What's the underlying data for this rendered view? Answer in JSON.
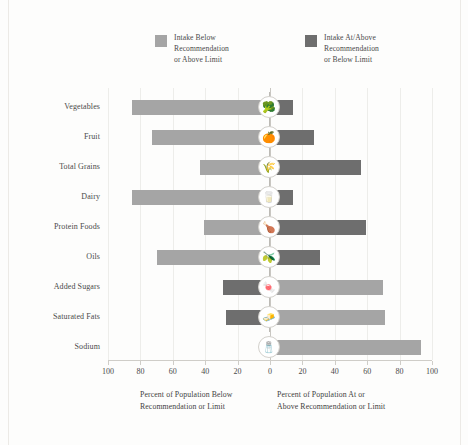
{
  "legend": {
    "items": [
      {
        "label": "Intake Below\nRecommendation\nor Above Limit",
        "color": "#a5a5a5",
        "name": "legend-below"
      },
      {
        "label": "Intake At/Above\nRecommendation\nor Below Limit",
        "color": "#6e6e6e",
        "name": "legend-at-above"
      }
    ]
  },
  "axes": {
    "y_title": "Food Group or Dietary Component",
    "x_caption_left": "Percent of Population Below\nRecommendation or Limit",
    "x_caption_right": "Percent of Population At or\nAbove Recommendation or Limit",
    "x_ticks": [
      "100",
      "80",
      "60",
      "40",
      "20",
      "0",
      "20",
      "40",
      "60",
      "80",
      "100"
    ]
  },
  "chart_data": {
    "type": "bar",
    "title": "",
    "xlabel": "Percent of Population",
    "ylabel": "Food Group or Dietary Component",
    "xlim": [
      -100,
      100
    ],
    "grid": true,
    "legend_position": "top",
    "categories": [
      "Vegetables",
      "Fruit",
      "Total Grains",
      "Dairy",
      "Protein Foods",
      "Oils",
      "Added Sugars",
      "Saturated Fats",
      "Sodium"
    ],
    "series": [
      {
        "name": "Intake Below Recommendation or Above Limit",
        "color": "#a5a5a5",
        "values": [
          85,
          73,
          43,
          85,
          41,
          70,
          70,
          71,
          93
        ]
      },
      {
        "name": "Intake At/Above Recommendation or Below Limit",
        "color": "#6e6e6e",
        "values": [
          14,
          27,
          56,
          14,
          59,
          31,
          29,
          27,
          4
        ]
      }
    ],
    "rows": [
      {
        "category": "Vegetables",
        "icon": "vegetables-icon",
        "glyph": "🥦",
        "left_value": 85,
        "left_color": "#a5a5a5",
        "right_value": 14,
        "right_color": "#6e6e6e"
      },
      {
        "category": "Fruit",
        "icon": "fruit-icon",
        "glyph": "🍊",
        "left_value": 73,
        "left_color": "#a5a5a5",
        "right_value": 27,
        "right_color": "#6e6e6e"
      },
      {
        "category": "Total Grains",
        "icon": "grains-icon",
        "glyph": "🌾",
        "left_value": 43,
        "left_color": "#a5a5a5",
        "right_value": 56,
        "right_color": "#6e6e6e"
      },
      {
        "category": "Dairy",
        "icon": "dairy-icon",
        "glyph": "🥛",
        "left_value": 85,
        "left_color": "#a5a5a5",
        "right_value": 14,
        "right_color": "#6e6e6e"
      },
      {
        "category": "Protein Foods",
        "icon": "protein-foods-icon",
        "glyph": "🍗",
        "left_value": 41,
        "left_color": "#a5a5a5",
        "right_value": 59,
        "right_color": "#6e6e6e"
      },
      {
        "category": "Oils",
        "icon": "oils-icon",
        "glyph": "🫒",
        "left_value": 70,
        "left_color": "#a5a5a5",
        "right_value": 31,
        "right_color": "#6e6e6e"
      },
      {
        "category": "Added Sugars",
        "icon": "added-sugars-icon",
        "glyph": "🍬",
        "left_value": 29,
        "left_color": "#6e6e6e",
        "right_value": 70,
        "right_color": "#a5a5a5"
      },
      {
        "category": "Saturated Fats",
        "icon": "saturated-fats-icon",
        "glyph": "🧈",
        "left_value": 27,
        "left_color": "#6e6e6e",
        "right_value": 71,
        "right_color": "#a5a5a5"
      },
      {
        "category": "Sodium",
        "icon": "sodium-icon",
        "glyph": "🧂",
        "left_value": 4,
        "left_color": "#6e6e6e",
        "right_value": 93,
        "right_color": "#a5a5a5"
      }
    ]
  },
  "colors": {
    "light_bar": "#a5a5a5",
    "dark_bar": "#6e6e6e",
    "grid": "#ededea",
    "axis": "#cfcdc8",
    "text": "#3a3a3a"
  }
}
